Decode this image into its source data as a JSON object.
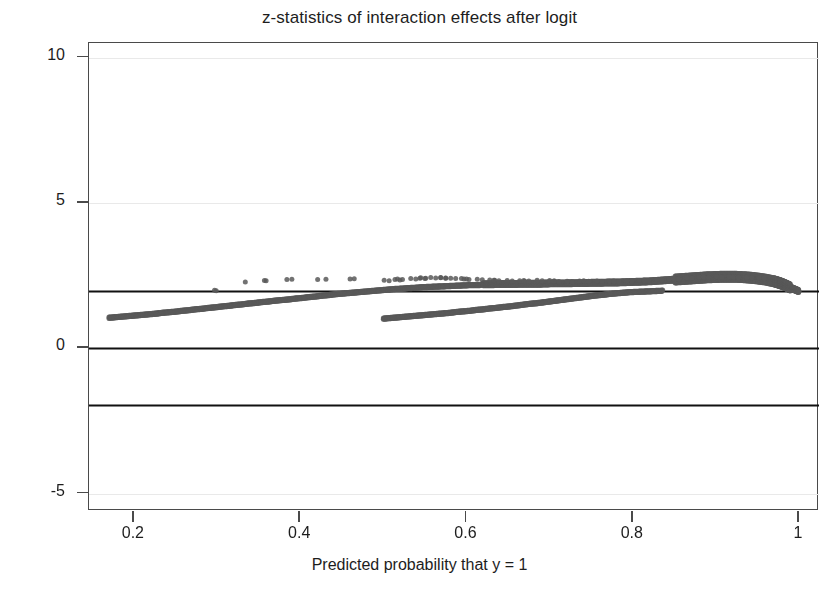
{
  "chart_data": {
    "type": "scatter",
    "title": "z-statistics of interaction effects after logit",
    "xlabel": "Predicted probability that y = 1",
    "ylabel": "z-statistic",
    "xlim": [
      0.146,
      1.024
    ],
    "ylim": [
      -5.6,
      10.5
    ],
    "xticks": [
      0.2,
      0.4,
      0.6,
      0.8,
      1
    ],
    "xtick_labels": [
      "0.2",
      "0.4",
      "0.6",
      "0.8",
      "1"
    ],
    "yticks": [
      10,
      5,
      0,
      -5
    ],
    "ytick_labels": [
      "10",
      "5",
      "0",
      "-5"
    ],
    "grid": false,
    "marker": {
      "shape": "circle",
      "size": 5,
      "color": "#595959",
      "opacity": 0.85
    },
    "reference_lines": [
      {
        "y": 1.96,
        "label": "+1.96 critical value",
        "color": "#111111",
        "width": 2
      },
      {
        "y": 0,
        "label": "zero line",
        "color": "#111111",
        "width": 2
      },
      {
        "y": -1.96,
        "label": "-1.96 critical value",
        "color": "#111111",
        "width": 2
      }
    ],
    "series": [
      {
        "name": "lower-left band",
        "comment": "dense band rising from (0.17, 1.07) merging into main ridge near p=0.62",
        "x": [
          0.17,
          0.178,
          0.186,
          0.194,
          0.202,
          0.21,
          0.218,
          0.226,
          0.234,
          0.242,
          0.25,
          0.258,
          0.266,
          0.274,
          0.282,
          0.29,
          0.298,
          0.306,
          0.314,
          0.322,
          0.33,
          0.338,
          0.346,
          0.354,
          0.362,
          0.37,
          0.378,
          0.386,
          0.394,
          0.402,
          0.41,
          0.418,
          0.426,
          0.434,
          0.442,
          0.45,
          0.458,
          0.466,
          0.474,
          0.482,
          0.49,
          0.498,
          0.506,
          0.514,
          0.522,
          0.53,
          0.538,
          0.546,
          0.554,
          0.562,
          0.57,
          0.578,
          0.586,
          0.594,
          0.602,
          0.61,
          0.618
        ],
        "y": [
          1.07,
          1.09,
          1.11,
          1.13,
          1.15,
          1.17,
          1.19,
          1.21,
          1.24,
          1.26,
          1.28,
          1.31,
          1.33,
          1.36,
          1.38,
          1.41,
          1.43,
          1.46,
          1.48,
          1.51,
          1.53,
          1.56,
          1.58,
          1.61,
          1.63,
          1.66,
          1.68,
          1.7,
          1.73,
          1.75,
          1.78,
          1.8,
          1.83,
          1.85,
          1.88,
          1.9,
          1.92,
          1.94,
          1.96,
          1.98,
          2.0,
          2.02,
          2.04,
          2.06,
          2.07,
          2.09,
          2.1,
          2.12,
          2.13,
          2.14,
          2.15,
          2.16,
          2.17,
          2.18,
          2.19,
          2.19,
          2.2
        ]
      },
      {
        "name": "lower-right band",
        "comment": "second dense band starting at p=0.50, z=1.05 rising to merge near p=0.84",
        "x": [
          0.5,
          0.508,
          0.516,
          0.524,
          0.532,
          0.54,
          0.548,
          0.556,
          0.564,
          0.572,
          0.58,
          0.588,
          0.596,
          0.604,
          0.612,
          0.62,
          0.628,
          0.636,
          0.644,
          0.652,
          0.66,
          0.668,
          0.676,
          0.684,
          0.692,
          0.7,
          0.708,
          0.716,
          0.724,
          0.732,
          0.74,
          0.748,
          0.756,
          0.764,
          0.772,
          0.78,
          0.788,
          0.796,
          0.804,
          0.812,
          0.82,
          0.828,
          0.836
        ],
        "y": [
          1.04,
          1.06,
          1.08,
          1.1,
          1.12,
          1.14,
          1.16,
          1.18,
          1.2,
          1.22,
          1.24,
          1.27,
          1.29,
          1.31,
          1.34,
          1.36,
          1.39,
          1.41,
          1.44,
          1.46,
          1.49,
          1.52,
          1.55,
          1.57,
          1.6,
          1.63,
          1.66,
          1.69,
          1.72,
          1.75,
          1.78,
          1.81,
          1.84,
          1.86,
          1.89,
          1.91,
          1.93,
          1.95,
          1.96,
          1.97,
          1.98,
          1.99,
          2.0
        ]
      },
      {
        "name": "main ridge",
        "comment": "dominant band from p=0.62 to p=1.0 peaking near z=2.45 around p=0.92 then falling to 1.96 at p=1.0",
        "x": [
          0.62,
          0.63,
          0.64,
          0.65,
          0.66,
          0.67,
          0.68,
          0.69,
          0.7,
          0.71,
          0.72,
          0.73,
          0.74,
          0.75,
          0.76,
          0.77,
          0.78,
          0.79,
          0.8,
          0.81,
          0.82,
          0.83,
          0.84,
          0.85,
          0.86,
          0.87,
          0.88,
          0.89,
          0.9,
          0.91,
          0.92,
          0.93,
          0.94,
          0.95,
          0.96,
          0.97,
          0.975,
          0.98,
          0.985,
          0.99,
          0.995,
          1.0
        ],
        "y": [
          2.2,
          2.2,
          2.21,
          2.21,
          2.21,
          2.22,
          2.22,
          2.22,
          2.23,
          2.23,
          2.23,
          2.24,
          2.24,
          2.25,
          2.25,
          2.26,
          2.26,
          2.27,
          2.28,
          2.29,
          2.3,
          2.32,
          2.34,
          2.36,
          2.38,
          2.4,
          2.42,
          2.44,
          2.45,
          2.46,
          2.46,
          2.45,
          2.43,
          2.4,
          2.36,
          2.3,
          2.26,
          2.21,
          2.15,
          2.08,
          2.02,
          1.96
        ]
      },
      {
        "name": "scattered upper points",
        "comment": "isolated markers above the ridge between p=0.29 and p=0.95",
        "x": [
          0.295,
          0.3,
          0.333,
          0.355,
          0.36,
          0.383,
          0.386,
          0.424,
          0.43,
          0.456,
          0.468,
          0.5,
          0.51,
          0.52,
          0.532,
          0.54,
          0.548,
          0.556,
          0.565,
          0.572,
          0.58,
          0.59,
          0.6,
          0.612,
          0.624,
          0.636,
          0.648,
          0.66,
          0.672,
          0.684,
          0.696,
          0.708,
          0.72,
          0.732,
          0.744,
          0.756,
          0.768,
          0.78,
          0.792,
          0.804,
          0.816,
          0.828,
          0.84,
          0.852,
          0.864,
          0.876,
          0.888,
          0.9,
          0.912,
          0.924,
          0.936,
          0.948
        ],
        "y": [
          1.98,
          1.99,
          2.28,
          2.32,
          2.33,
          2.36,
          2.37,
          2.36,
          2.37,
          2.38,
          2.39,
          2.34,
          2.36,
          2.38,
          2.4,
          2.41,
          2.42,
          2.43,
          2.43,
          2.42,
          2.41,
          2.4,
          2.38,
          2.37,
          2.35,
          2.34,
          2.33,
          2.32,
          2.33,
          2.34,
          2.33,
          2.31,
          2.3,
          2.31,
          2.32,
          2.31,
          2.3,
          2.31,
          2.32,
          2.33,
          2.34,
          2.36,
          2.38,
          2.4,
          2.42,
          2.44,
          2.45,
          2.46,
          2.46,
          2.45,
          2.44,
          2.42
        ]
      }
    ]
  },
  "axes": {
    "title": "z-statistics of interaction effects after logit",
    "x_label": "Predicted probability that y = 1",
    "y_label": "z-statistic",
    "x_tick_labels": [
      "0.2",
      "0.4",
      "0.6",
      "0.8",
      "1"
    ],
    "y_tick_labels": [
      "10",
      "5",
      "0",
      "-5"
    ]
  },
  "colors": {
    "marker": "#595959",
    "reference_line": "#111111",
    "frame": "#4a4a4a",
    "background": "#ffffff",
    "text": "#1d1d1d"
  }
}
